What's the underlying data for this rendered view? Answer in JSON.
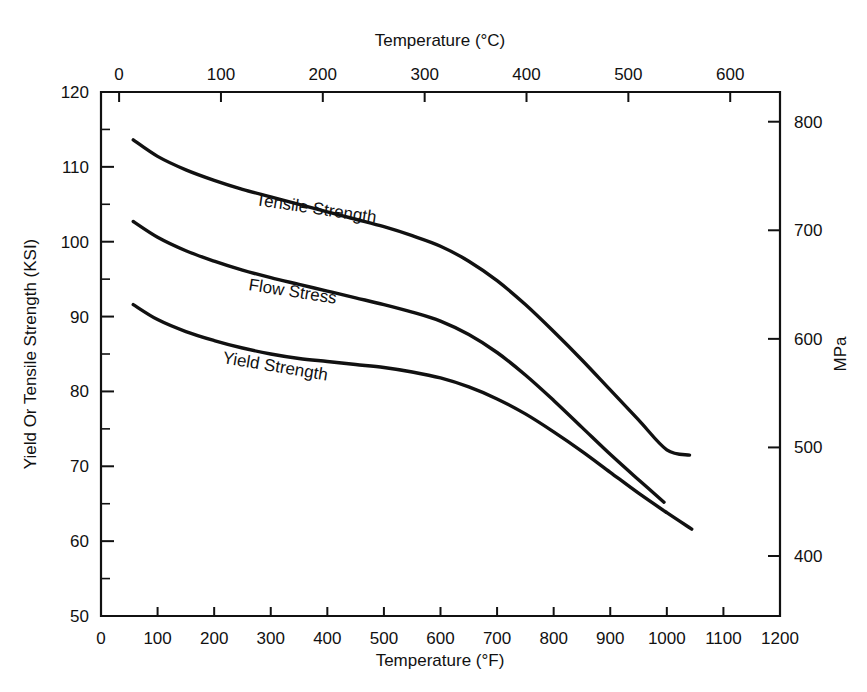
{
  "chart_data": {
    "type": "line",
    "title": "",
    "xlabel": "Temperature (°F)",
    "ylabel": "Yield Or Tensile Strength (KSI)",
    "x2label": "Temperature (°C)",
    "y2label": "MPa",
    "xlim": [
      0,
      1200
    ],
    "ylim": [
      50,
      120
    ],
    "x2lim": [
      -17.8,
      648.9
    ],
    "y2lim": [
      344.7,
      827.4
    ],
    "grid": false,
    "legend": "inline-curve-labels",
    "x_ticks": [
      0,
      100,
      200,
      300,
      400,
      500,
      600,
      700,
      800,
      900,
      1000,
      1100,
      1200
    ],
    "x_tick_labels": [
      "0",
      "100",
      "200",
      "300",
      "400",
      "500",
      "600",
      "700",
      "800",
      "900",
      "1000",
      "1100",
      "1200"
    ],
    "y_ticks": [
      50,
      60,
      70,
      80,
      90,
      100,
      110,
      120
    ],
    "y_tick_labels": [
      "50",
      "60",
      "70",
      "80",
      "90",
      "100",
      "110",
      "120"
    ],
    "y_minor_ticks": [
      55,
      65,
      75,
      85,
      95,
      105,
      115
    ],
    "x2_ticks": [
      0,
      100,
      200,
      300,
      400,
      500,
      600
    ],
    "x2_tick_labels": [
      "0",
      "100",
      "200",
      "300",
      "400",
      "500",
      "600"
    ],
    "y2_ticks": [
      400,
      500,
      600,
      700,
      800
    ],
    "y2_tick_labels": [
      "400",
      "500",
      "600",
      "700",
      "800"
    ],
    "series": [
      {
        "name": "Tensile Strength",
        "label": "Tensile Strength",
        "color": "#111111",
        "points": [
          [
            57,
            113.6
          ],
          [
            100,
            111.4
          ],
          [
            150,
            109.6
          ],
          [
            200,
            108.2
          ],
          [
            250,
            107.0
          ],
          [
            300,
            106.0
          ],
          [
            350,
            105.0
          ],
          [
            400,
            104.0
          ],
          [
            450,
            103.0
          ],
          [
            500,
            102.0
          ],
          [
            550,
            100.8
          ],
          [
            600,
            99.4
          ],
          [
            650,
            97.4
          ],
          [
            700,
            94.8
          ],
          [
            750,
            91.6
          ],
          [
            800,
            88.0
          ],
          [
            850,
            84.2
          ],
          [
            900,
            80.2
          ],
          [
            950,
            76.2
          ],
          [
            1000,
            72.2
          ],
          [
            1040,
            71.5
          ]
        ]
      },
      {
        "name": "Flow Stress",
        "label": "Flow Stress",
        "color": "#111111",
        "points": [
          [
            57,
            102.7
          ],
          [
            100,
            100.6
          ],
          [
            150,
            98.8
          ],
          [
            200,
            97.4
          ],
          [
            250,
            96.2
          ],
          [
            300,
            95.2
          ],
          [
            350,
            94.3
          ],
          [
            400,
            93.4
          ],
          [
            450,
            92.5
          ],
          [
            500,
            91.6
          ],
          [
            550,
            90.6
          ],
          [
            600,
            89.4
          ],
          [
            650,
            87.6
          ],
          [
            700,
            85.2
          ],
          [
            750,
            82.2
          ],
          [
            800,
            78.8
          ],
          [
            850,
            75.2
          ],
          [
            900,
            71.6
          ],
          [
            950,
            68.2
          ],
          [
            995,
            65.2
          ]
        ]
      },
      {
        "name": "Yield Strength",
        "label": "Yield Strength",
        "color": "#111111",
        "points": [
          [
            57,
            91.6
          ],
          [
            100,
            89.6
          ],
          [
            150,
            88.0
          ],
          [
            200,
            86.8
          ],
          [
            250,
            85.8
          ],
          [
            300,
            85.0
          ],
          [
            350,
            84.4
          ],
          [
            400,
            84.0
          ],
          [
            450,
            83.6
          ],
          [
            500,
            83.2
          ],
          [
            550,
            82.6
          ],
          [
            600,
            81.8
          ],
          [
            650,
            80.6
          ],
          [
            700,
            79.0
          ],
          [
            750,
            77.0
          ],
          [
            800,
            74.6
          ],
          [
            850,
            72.0
          ],
          [
            900,
            69.2
          ],
          [
            950,
            66.4
          ],
          [
            1000,
            63.8
          ],
          [
            1044,
            61.6
          ]
        ]
      }
    ]
  },
  "axes": {
    "top_title": "Temperature (°C)",
    "bottom_title": "Temperature (°F)",
    "left_title": "Yield Or Tensile Strength (KSI)",
    "right_title": "MPa"
  },
  "curve_labels": {
    "tensile": "Tensile Strength",
    "flow": "Flow Stress",
    "yield": "Yield Strength"
  }
}
